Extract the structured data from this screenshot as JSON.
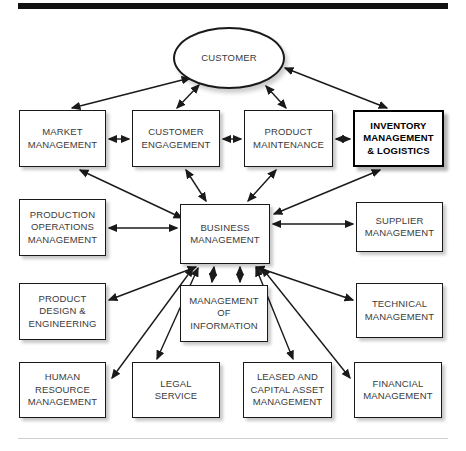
{
  "diagram": {
    "type": "block-relationship-diagram",
    "title_bar": {
      "name": "top-rule",
      "color": "#111111"
    },
    "footer_rule": {
      "name": "bottom-rule",
      "color": "#cfcfcf"
    },
    "nodes": [
      {
        "id": "customer",
        "label": "CUSTOMER",
        "shape": "ellipse",
        "emphasis": false,
        "x": 173,
        "y": 27,
        "w": 112,
        "h": 62
      },
      {
        "id": "market",
        "label": "MARKET\nMANAGEMENT",
        "shape": "rect",
        "emphasis": false,
        "x": 19,
        "y": 110,
        "w": 87,
        "h": 57
      },
      {
        "id": "engage",
        "label": "CUSTOMER\nENGAGEMENT",
        "shape": "rect",
        "emphasis": false,
        "x": 132,
        "y": 110,
        "w": 88,
        "h": 57
      },
      {
        "id": "prodmaint",
        "label": "PRODUCT\nMAINTENANCE",
        "shape": "rect",
        "emphasis": false,
        "x": 244,
        "y": 110,
        "w": 89,
        "h": 57
      },
      {
        "id": "inventory",
        "label": "INVENTORY\nMANAGEMENT\n& LOGISTICS",
        "shape": "rect",
        "emphasis": true,
        "x": 353,
        "y": 110,
        "w": 91,
        "h": 57
      },
      {
        "id": "prodops",
        "label": "PRODUCTION\nOPERATIONS\nMANAGEMENT",
        "shape": "rect",
        "emphasis": false,
        "x": 19,
        "y": 199,
        "w": 87,
        "h": 57
      },
      {
        "id": "business",
        "label": "BUSINESS\nMANAGEMENT",
        "shape": "rect",
        "emphasis": false,
        "x": 180,
        "y": 204,
        "w": 90,
        "h": 60
      },
      {
        "id": "supplier",
        "label": "SUPPLIER\nMANAGEMENT",
        "shape": "rect",
        "emphasis": false,
        "x": 356,
        "y": 202,
        "w": 87,
        "h": 50
      },
      {
        "id": "design",
        "label": "PRODUCT\nDESIGN &\nENGINEERING",
        "shape": "rect",
        "emphasis": false,
        "x": 19,
        "y": 283,
        "w": 87,
        "h": 57
      },
      {
        "id": "infomgmt",
        "label": "MANAGEMENT\nOF\nINFORMATION",
        "shape": "rect",
        "emphasis": false,
        "x": 180,
        "y": 285,
        "w": 88,
        "h": 57
      },
      {
        "id": "technical",
        "label": "TECHNICAL\nMANAGEMENT",
        "shape": "rect",
        "emphasis": false,
        "x": 356,
        "y": 283,
        "w": 87,
        "h": 55
      },
      {
        "id": "hr",
        "label": "HUMAN\nRESOURCE\nMANAGEMENT",
        "shape": "rect",
        "emphasis": false,
        "x": 19,
        "y": 362,
        "w": 87,
        "h": 56
      },
      {
        "id": "legal",
        "label": "LEGAL\nSERVICE",
        "shape": "rect",
        "emphasis": false,
        "x": 132,
        "y": 362,
        "w": 88,
        "h": 56
      },
      {
        "id": "leased",
        "label": "LEASED AND\nCAPITAL ASSET\nMANAGEMENT",
        "shape": "rect",
        "emphasis": false,
        "x": 243,
        "y": 362,
        "w": 89,
        "h": 56
      },
      {
        "id": "financial",
        "label": "FINANCIAL\nMANAGEMENT",
        "shape": "rect",
        "emphasis": false,
        "x": 354,
        "y": 362,
        "w": 88,
        "h": 56
      }
    ],
    "edges": [
      {
        "from": "market",
        "to": "customer",
        "arrow": "both",
        "x1": 72,
        "y1": 108,
        "x2": 190,
        "y2": 78
      },
      {
        "from": "engage",
        "to": "customer",
        "arrow": "both",
        "x1": 177,
        "y1": 108,
        "x2": 199,
        "y2": 85
      },
      {
        "from": "prodmaint",
        "to": "customer",
        "arrow": "both",
        "x1": 286,
        "y1": 108,
        "x2": 266,
        "y2": 86
      },
      {
        "from": "inventory",
        "to": "customer",
        "arrow": "both",
        "x1": 387,
        "y1": 108,
        "x2": 285,
        "y2": 68
      },
      {
        "from": "market",
        "to": "engage",
        "arrow": "both",
        "x1": 109,
        "y1": 139,
        "x2": 129,
        "y2": 139
      },
      {
        "from": "engage",
        "to": "prodmaint",
        "arrow": "both",
        "x1": 223,
        "y1": 139,
        "x2": 241,
        "y2": 139
      },
      {
        "from": "prodmaint",
        "to": "inventory",
        "arrow": "both",
        "x1": 336,
        "y1": 139,
        "x2": 350,
        "y2": 139
      },
      {
        "from": "market",
        "to": "business",
        "arrow": "both",
        "x1": 80,
        "y1": 170,
        "x2": 182,
        "y2": 218
      },
      {
        "from": "engage",
        "to": "business",
        "arrow": "both",
        "x1": 186,
        "y1": 170,
        "x2": 206,
        "y2": 201
      },
      {
        "from": "prodmaint",
        "to": "business",
        "arrow": "both",
        "x1": 276,
        "y1": 170,
        "x2": 248,
        "y2": 201
      },
      {
        "from": "inventory",
        "to": "business",
        "arrow": "both",
        "x1": 380,
        "y1": 170,
        "x2": 274,
        "y2": 214
      },
      {
        "from": "prodops",
        "to": "business",
        "arrow": "both",
        "x1": 109,
        "y1": 228,
        "x2": 177,
        "y2": 228
      },
      {
        "from": "business",
        "to": "supplier",
        "arrow": "both",
        "x1": 273,
        "y1": 224,
        "x2": 353,
        "y2": 224
      },
      {
        "from": "design",
        "to": "business",
        "arrow": "both",
        "x1": 109,
        "y1": 300,
        "x2": 196,
        "y2": 267
      },
      {
        "from": "business",
        "to": "technical",
        "arrow": "both",
        "x1": 256,
        "y1": 267,
        "x2": 353,
        "y2": 300
      },
      {
        "from": "infomgmt",
        "to": "business",
        "arrow": "both",
        "x1": 212,
        "y1": 282,
        "x2": 214,
        "y2": 267
      },
      {
        "from": "infomgmt",
        "to": "business",
        "arrow": "both",
        "x1": 240,
        "y1": 282,
        "x2": 240,
        "y2": 267
      },
      {
        "from": "hr",
        "to": "business",
        "arrow": "both",
        "x1": 112,
        "y1": 378,
        "x2": 193,
        "y2": 268
      },
      {
        "from": "legal",
        "to": "business",
        "arrow": "both",
        "x1": 157,
        "y1": 359,
        "x2": 198,
        "y2": 268
      },
      {
        "from": "leased",
        "to": "business",
        "arrow": "both",
        "x1": 293,
        "y1": 359,
        "x2": 256,
        "y2": 268
      },
      {
        "from": "financial",
        "to": "business",
        "arrow": "both",
        "x1": 350,
        "y1": 378,
        "x2": 262,
        "y2": 268
      }
    ]
  }
}
